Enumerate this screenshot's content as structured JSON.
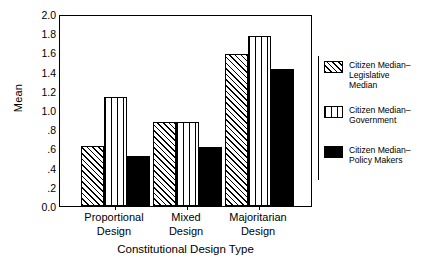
{
  "chart_data": {
    "type": "bar",
    "title": "",
    "xlabel": "Constitutional Design Type",
    "ylabel": "Mean",
    "categories": [
      "Proportional Design",
      "Mixed Design",
      "Majoritarian Design"
    ],
    "category_lines": [
      [
        "Proportional",
        "Design"
      ],
      [
        "Mixed",
        "Design"
      ],
      [
        "Majoritarian",
        "Design"
      ]
    ],
    "series": [
      {
        "name": "Citizen Median–Legislative Median",
        "name_lines": [
          "Citizen Median–",
          "Legislative",
          "Median"
        ],
        "pattern": "diagonal-hatch",
        "values": [
          0.62,
          0.88,
          1.58
        ]
      },
      {
        "name": "Citizen Median–Government",
        "name_lines": [
          "Citizen Median–",
          "Government"
        ],
        "pattern": "vertical-stripes",
        "values": [
          1.14,
          0.88,
          1.77
        ]
      },
      {
        "name": "Citizen Median–Policy Makers",
        "name_lines": [
          "Citizen Median–",
          "Policy Makers"
        ],
        "pattern": "solid-black",
        "values": [
          0.52,
          0.61,
          1.43
        ]
      }
    ],
    "ylim": [
      0.0,
      2.0
    ],
    "yticks": [
      "0.0",
      ".2",
      ".4",
      ".6",
      ".8",
      "1.0",
      "1.2",
      "1.4",
      "1.6",
      "1.8",
      "2.0"
    ],
    "ytick_values": [
      0.0,
      0.2,
      0.4,
      0.6,
      0.8,
      1.0,
      1.2,
      1.4,
      1.6,
      1.8,
      2.0
    ],
    "grid": false,
    "legend_position": "right",
    "colors": {
      "foreground": "#000000",
      "background": "#ffffff"
    }
  },
  "legend": {
    "items": [
      {
        "label": "Citizen Median–Legislative Median"
      },
      {
        "label": "Citizen Median–Government"
      },
      {
        "label": "Citizen Median–Policy Makers"
      }
    ]
  }
}
